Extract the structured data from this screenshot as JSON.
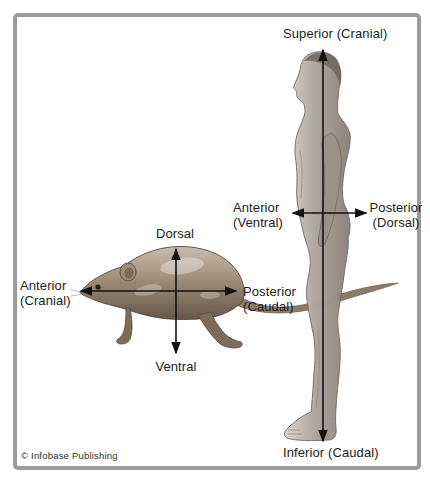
{
  "diagram": {
    "credit": "© Infobase Publishing",
    "human": {
      "superior": "Superior (Cranial)",
      "inferior": "Inferior (Caudal)",
      "anterior": {
        "line1": "Anterior",
        "line2": "(Ventral)"
      },
      "posterior": {
        "line1": "Posterior",
        "line2": "(Dorsal)"
      }
    },
    "rat": {
      "dorsal": "Dorsal",
      "ventral": "Ventral",
      "anterior": {
        "line1": "Anterior",
        "line2": "(Cranial)"
      },
      "posterior": {
        "line1": "Posterior",
        "line2": "(Caudal)"
      }
    },
    "colors": {
      "frame_border": "#9b9b9b",
      "label_text": "#1c1c1c",
      "axis": "#121212",
      "background": "#ffffff",
      "rat_body": "#9a8876",
      "human_body": "#a39b92"
    }
  }
}
